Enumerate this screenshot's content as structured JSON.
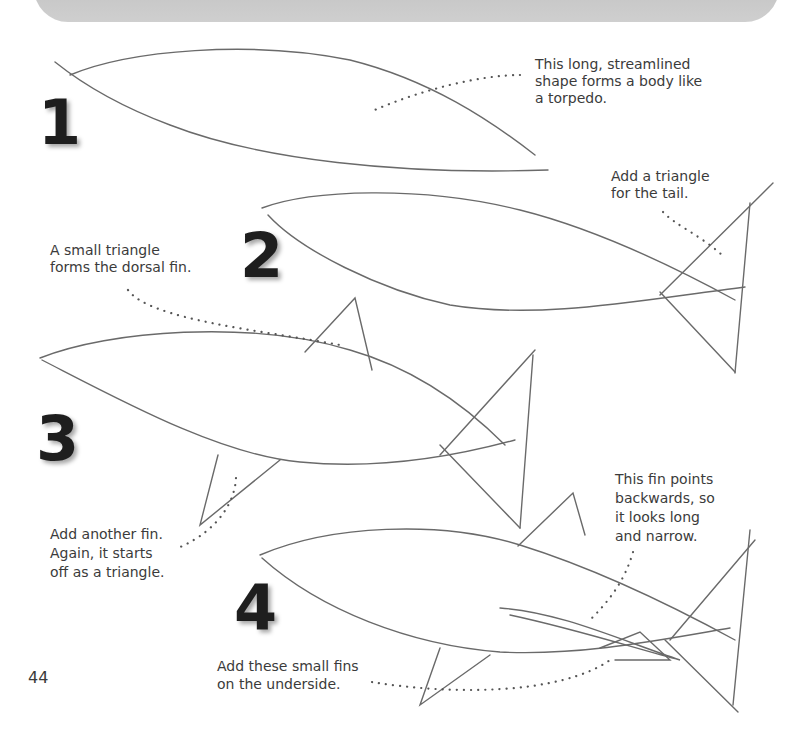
{
  "page": {
    "page_number": "44",
    "steps": [
      {
        "number": "1",
        "caption": "This long, streamlined shape forms a body like a torpedo.",
        "caption_lines": [
          "This long, streamlined",
          "shape forms a body like",
          "a torpedo."
        ]
      },
      {
        "number": "2",
        "caption": "Add a triangle for the tail.",
        "caption_lines": [
          "Add a triangle",
          "for the tail."
        ],
        "caption2_lines": [
          "A small triangle",
          "forms the dorsal fin."
        ]
      },
      {
        "number": "3",
        "caption_lines": [
          "Add another fin.",
          "Again, it starts",
          "off as a triangle."
        ]
      },
      {
        "number": "4",
        "caption_lines": [
          "This fin points",
          "backwards, so",
          "it looks long",
          "and narrow."
        ],
        "caption2_lines": [
          "Add these small fins",
          "on the underside."
        ]
      }
    ]
  }
}
